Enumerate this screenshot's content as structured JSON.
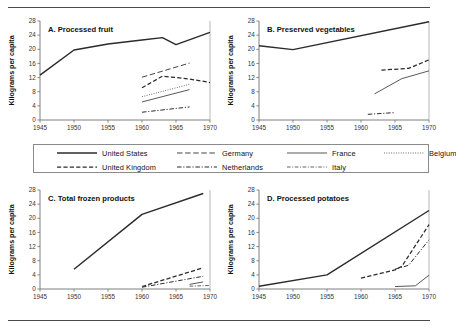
{
  "figure": {
    "axis_y_title": "Kilograms per capita",
    "y_ticks": [
      0,
      4,
      8,
      12,
      16,
      20,
      24,
      28
    ],
    "x_ticks": [
      1945,
      1950,
      1955,
      1960,
      1965,
      1970
    ],
    "ylim": [
      0,
      28
    ],
    "xlim": [
      1945,
      1970
    ]
  },
  "legend": {
    "items": [
      {
        "label": "United States",
        "style": "solid-thick",
        "key": "united-states"
      },
      {
        "label": "Germany",
        "style": "long-dash",
        "key": "germany"
      },
      {
        "label": "France",
        "style": "solid-thin",
        "key": "france"
      },
      {
        "label": "Belgium",
        "style": "dotted",
        "key": "belgium"
      },
      {
        "label": "United Kingdom",
        "style": "dashed",
        "key": "united-kingdom"
      },
      {
        "label": "Netherlands",
        "style": "dash-dot",
        "key": "netherlands"
      },
      {
        "label": "Italy",
        "style": "dash-dot-thin",
        "key": "italy"
      }
    ]
  },
  "chart_data": [
    {
      "type": "line",
      "panel": "A",
      "title": "A. Processed fruit",
      "xlabel": "",
      "ylabel": "Kilograms per capita",
      "xlim": [
        1945,
        1970
      ],
      "ylim": [
        0,
        28
      ],
      "grid": false,
      "legend_position": "shared-center",
      "series": [
        {
          "name": "United States",
          "style": "solid-thick",
          "x": [
            1945,
            1950,
            1955,
            1960,
            1963,
            1965,
            1970
          ],
          "y": [
            12.7,
            19.8,
            21.5,
            22.6,
            23.3,
            21.3,
            24.8
          ]
        },
        {
          "name": "Germany",
          "style": "long-dash",
          "x": [
            1960,
            1967
          ],
          "y": [
            12.1,
            16.1
          ]
        },
        {
          "name": "United Kingdom",
          "style": "dashed",
          "x": [
            1960,
            1963,
            1967,
            1970
          ],
          "y": [
            9.1,
            12.4,
            11.6,
            10.6
          ]
        },
        {
          "name": "Belgium",
          "style": "dotted",
          "x": [
            1960,
            1967
          ],
          "y": [
            6.6,
            10.1
          ]
        },
        {
          "name": "France",
          "style": "solid-thin",
          "x": [
            1960,
            1967
          ],
          "y": [
            5.1,
            8.6
          ]
        },
        {
          "name": "Netherlands",
          "style": "dash-dot",
          "x": [
            1960,
            1967
          ],
          "y": [
            2.2,
            3.7
          ]
        }
      ]
    },
    {
      "type": "line",
      "panel": "B",
      "title": "B. Preserved vegetables",
      "xlabel": "",
      "ylabel": "Kilograms per capita",
      "xlim": [
        1945,
        1970
      ],
      "ylim": [
        0,
        28
      ],
      "grid": false,
      "legend_position": "shared-center",
      "series": [
        {
          "name": "United States",
          "style": "solid-thick",
          "x": [
            1945,
            1950,
            1970
          ],
          "y": [
            21.0,
            19.9,
            27.8
          ]
        },
        {
          "name": "United Kingdom",
          "style": "dashed",
          "x": [
            1963,
            1967,
            1970
          ],
          "y": [
            14.1,
            14.6,
            17.0
          ]
        },
        {
          "name": "France",
          "style": "solid-thin",
          "x": [
            1962,
            1966,
            1970
          ],
          "y": [
            7.4,
            11.7,
            13.9
          ]
        },
        {
          "name": "Netherlands",
          "style": "dash-dot",
          "x": [
            1961,
            1965
          ],
          "y": [
            1.6,
            2.1
          ]
        }
      ]
    },
    {
      "type": "line",
      "panel": "C",
      "title": "C. Total frozen products",
      "xlabel": "",
      "ylabel": "Kilograms per capita",
      "xlim": [
        1945,
        1970
      ],
      "ylim": [
        0,
        28
      ],
      "grid": false,
      "legend_position": "shared-center",
      "series": [
        {
          "name": "United States",
          "style": "solid-thick",
          "x": [
            1950,
            1960,
            1969
          ],
          "y": [
            5.6,
            21.1,
            27.0
          ]
        },
        {
          "name": "United Kingdom",
          "style": "dashed",
          "x": [
            1960,
            1969
          ],
          "y": [
            0.7,
            6.0
          ]
        },
        {
          "name": "Netherlands",
          "style": "dash-dot",
          "x": [
            1960,
            1969
          ],
          "y": [
            0.5,
            3.6
          ]
        },
        {
          "name": "France",
          "style": "solid-thin",
          "x": [
            1967,
            1969
          ],
          "y": [
            1.3,
            2.0
          ]
        },
        {
          "name": "Italy",
          "style": "dash-dot-thin",
          "x": [
            1967,
            1970
          ],
          "y": [
            0.8,
            1.0
          ]
        }
      ]
    },
    {
      "type": "line",
      "panel": "D",
      "title": "D. Processed potatoes",
      "xlabel": "",
      "ylabel": "Kilograms per capita",
      "xlim": [
        1945,
        1970
      ],
      "ylim": [
        0,
        28
      ],
      "grid": false,
      "legend_position": "shared-center",
      "series": [
        {
          "name": "United States",
          "style": "solid-thick",
          "x": [
            1945,
            1955,
            1970
          ],
          "y": [
            0.8,
            4.0,
            22.2
          ]
        },
        {
          "name": "United Kingdom",
          "style": "dashed",
          "x": [
            1960,
            1965,
            1966,
            1970
          ],
          "y": [
            3.1,
            5.4,
            6.4,
            18.2
          ]
        },
        {
          "name": "Netherlands",
          "style": "dash-dot",
          "x": [
            1965,
            1967,
            1970
          ],
          "y": [
            5.6,
            6.7,
            13.9
          ]
        },
        {
          "name": "France",
          "style": "solid-thin",
          "x": [
            1965,
            1968,
            1970
          ],
          "y": [
            0.7,
            0.9,
            3.9
          ]
        }
      ]
    }
  ]
}
